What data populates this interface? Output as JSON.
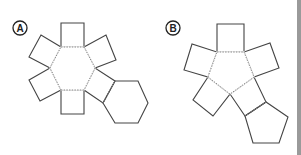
{
  "figures": [
    {
      "id": "A",
      "label": "A",
      "label_center": [
        20,
        28
      ],
      "description": "Net of a hexagonal prism",
      "base_shape": "hexagon",
      "base": [
        [
          61,
          47
        ],
        [
          84,
          47
        ],
        [
          95,
          68
        ],
        [
          84,
          90
        ],
        [
          61,
          90
        ],
        [
          50,
          68
        ]
      ],
      "lateral_faces": [
        [
          [
            61,
            47
          ],
          [
            84,
            47
          ],
          [
            84,
            23
          ],
          [
            61,
            23
          ]
        ],
        [
          [
            61,
            47
          ],
          [
            50,
            68
          ],
          [
            29,
            57
          ],
          [
            41,
            35
          ]
        ],
        [
          [
            84,
            47
          ],
          [
            95,
            68
          ],
          [
            116,
            60
          ],
          [
            106,
            35
          ]
        ],
        [
          [
            50,
            68
          ],
          [
            61,
            90
          ],
          [
            40,
            101
          ],
          [
            29,
            80
          ]
        ],
        [
          [
            61,
            90
          ],
          [
            84,
            90
          ],
          [
            84,
            114
          ],
          [
            61,
            114
          ]
        ],
        [
          [
            95,
            68
          ],
          [
            84,
            90
          ],
          [
            103,
            103
          ],
          [
            115,
            81
          ]
        ]
      ],
      "second_base": [
        [
          115,
          81
        ],
        [
          138,
          81
        ],
        [
          148,
          103
        ],
        [
          138,
          123
        ],
        [
          115,
          123
        ],
        [
          103,
          103
        ]
      ]
    },
    {
      "id": "B",
      "label": "B",
      "label_center": [
        173,
        28
      ],
      "description": "Net of a pentagonal prism",
      "base_shape": "pentagon",
      "base": [
        [
          217,
          52
        ],
        [
          244,
          52
        ],
        [
          254,
          77
        ],
        [
          230,
          94
        ],
        [
          208,
          77
        ]
      ],
      "lateral_faces": [
        [
          [
            217,
            52
          ],
          [
            244,
            52
          ],
          [
            244,
            24
          ],
          [
            217,
            24
          ]
        ],
        [
          [
            217,
            52
          ],
          [
            208,
            77
          ],
          [
            184,
            70
          ],
          [
            192,
            44
          ]
        ],
        [
          [
            244,
            52
          ],
          [
            254,
            77
          ],
          [
            279,
            68
          ],
          [
            270,
            43
          ]
        ],
        [
          [
            208,
            77
          ],
          [
            230,
            94
          ],
          [
            213,
            116
          ],
          [
            193,
            100
          ]
        ],
        [
          [
            230,
            94
          ],
          [
            254,
            77
          ],
          [
            266,
            102
          ],
          [
            245,
            116
          ]
        ]
      ],
      "second_base": [
        [
          245,
          116
        ],
        [
          266,
          102
        ],
        [
          288,
          117
        ],
        [
          279,
          143
        ],
        [
          253,
          143
        ]
      ]
    }
  ],
  "colors": {
    "stroke": "#444444",
    "fold": "#888888",
    "background": "#ffffff",
    "edge_bar": "#9a9a9a"
  }
}
